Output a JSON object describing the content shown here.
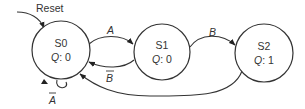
{
  "diagram": {
    "type": "finite-state-machine",
    "reset_label": "Reset",
    "states": [
      {
        "id": "S0",
        "name": "S0",
        "output": "Q: 0",
        "output_var": "Q",
        "output_val": "0"
      },
      {
        "id": "S1",
        "name": "S1",
        "output": "Q: 0",
        "output_var": "Q",
        "output_val": "0"
      },
      {
        "id": "S2",
        "name": "S2",
        "output": "Q: 1",
        "output_var": "Q",
        "output_val": "1"
      }
    ],
    "transitions": [
      {
        "from": "S0",
        "to": "S1",
        "label": "A",
        "negated": false
      },
      {
        "from": "S1",
        "to": "S0",
        "label": "B",
        "negated": true
      },
      {
        "from": "S1",
        "to": "S2",
        "label": "B",
        "negated": false
      },
      {
        "from": "S2",
        "to": "S0",
        "label": "",
        "negated": false
      },
      {
        "from": "S0",
        "to": "S0",
        "label": "A",
        "negated": true
      }
    ],
    "colors": {
      "stroke": "#333333",
      "background": "#ffffff"
    }
  }
}
